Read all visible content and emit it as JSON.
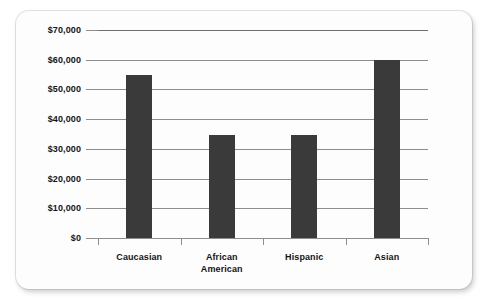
{
  "chart_data": {
    "type": "bar",
    "title": "",
    "xlabel": "",
    "ylabel": "",
    "categories": [
      "Caucasian",
      "African American",
      "Hispanic",
      "Asian"
    ],
    "values": [
      55000,
      34700,
      34800,
      60000
    ],
    "ylim": [
      0,
      70000
    ],
    "ytick_labels": [
      "$70,000",
      "$60,000",
      "$50,000",
      "$40,000",
      "$30,000",
      "$20,000",
      "$10,000",
      "$0"
    ],
    "ytick_values": [
      70000,
      60000,
      50000,
      40000,
      30000,
      20000,
      10000,
      0
    ],
    "grid": true,
    "legend": false,
    "bar_color": "#3a3a3a",
    "gridline_color": "#8d8d8d",
    "background_color": "#fdfdfd"
  },
  "axis": {
    "y_ticks": [
      {
        "label": "$70,000",
        "value": 70000
      },
      {
        "label": "$60,000",
        "value": 60000
      },
      {
        "label": "$50,000",
        "value": 50000
      },
      {
        "label": "$40,000",
        "value": 40000
      },
      {
        "label": "$30,000",
        "value": 30000
      },
      {
        "label": "$20,000",
        "value": 20000
      },
      {
        "label": "$10,000",
        "value": 10000
      },
      {
        "label": "$0",
        "value": 0
      }
    ],
    "x_categories": [
      {
        "label": "Caucasian",
        "value": 55000
      },
      {
        "label": "African\nAmerican",
        "value": 34700
      },
      {
        "label": "Hispanic",
        "value": 34800
      },
      {
        "label": "Asian",
        "value": 60000
      }
    ]
  }
}
